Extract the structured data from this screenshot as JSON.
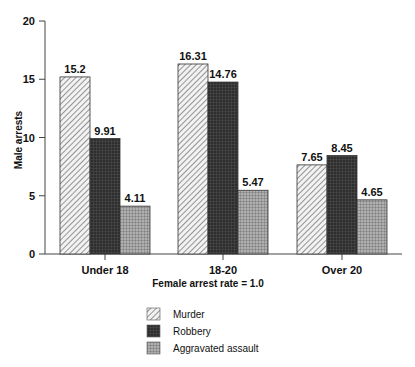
{
  "chart_data": {
    "type": "bar",
    "title": "",
    "xlabel": "Female arrest rate = 1.0",
    "ylabel": "Male arrests",
    "ylim": [
      0,
      20
    ],
    "yticks": [
      0,
      5,
      10,
      15,
      20
    ],
    "grid": false,
    "legend_position": "bottom",
    "categories": [
      "Under 18",
      "18-20",
      "Over 20"
    ],
    "series": [
      {
        "name": "Murder",
        "values": [
          15.2,
          16.31,
          7.65
        ],
        "value_labels": [
          "15.2",
          "16.31",
          "7.65"
        ],
        "pattern": "diagonal-hatch"
      },
      {
        "name": "Robbery",
        "values": [
          9.91,
          14.76,
          8.45
        ],
        "value_labels": [
          "9.91",
          "14.76",
          "8.45"
        ],
        "pattern": "dark-crosshatch"
      },
      {
        "name": "Aggravated assault",
        "values": [
          4.11,
          5.47,
          4.65
        ],
        "value_labels": [
          "4.11",
          "5.47",
          "4.65"
        ],
        "pattern": "light-grid"
      }
    ]
  },
  "colors": {
    "murder": "#d8d8d8",
    "robbery": "#333333",
    "aggravated": "#9a9a9a",
    "axis": "#444444"
  }
}
